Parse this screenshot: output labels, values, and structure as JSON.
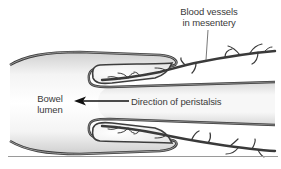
{
  "figure": {
    "labels": {
      "vessels_line1": "Blood vessels",
      "vessels_line2": "in mesentery",
      "lumen_line1": "Bowel",
      "lumen_line2": "lumen",
      "direction": "Direction of peristalsis"
    },
    "colors": {
      "wall_stroke": "#3d3d3d",
      "wall_inner": "#a8a8a8",
      "lumen_shade": "#d9d9d9",
      "text": "#3a3a3a",
      "rule": "#9a9a9a"
    }
  }
}
